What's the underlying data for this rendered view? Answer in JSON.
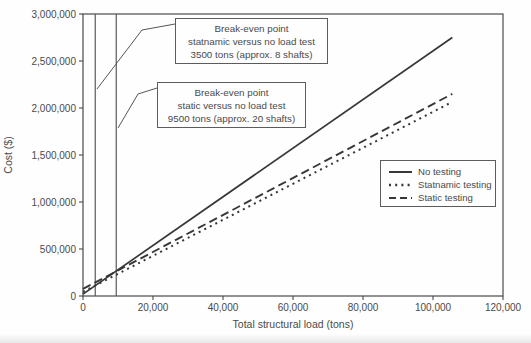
{
  "chart_data": {
    "type": "line",
    "title": "",
    "xlabel": "Total structural load (tons)",
    "ylabel": "Cost ($)",
    "xlim": [
      0,
      120000
    ],
    "ylim": [
      0,
      3000000
    ],
    "x_ticks": [
      0,
      20000,
      40000,
      60000,
      80000,
      100000,
      120000
    ],
    "y_ticks": [
      0,
      500000,
      1000000,
      1500000,
      2000000,
      2500000,
      3000000
    ],
    "grid": false,
    "legend_position": "right-center",
    "series": [
      {
        "name": "No testing",
        "style": "solid",
        "points": [
          [
            0,
            20000
          ],
          [
            105500,
            2750000
          ]
        ]
      },
      {
        "name": "Statnamic testing",
        "style": "dotted",
        "points": [
          [
            0,
            45000
          ],
          [
            105500,
            2065000
          ]
        ]
      },
      {
        "name": "Static testing",
        "style": "dashed",
        "points": [
          [
            0,
            75000
          ],
          [
            105500,
            2150000
          ]
        ]
      }
    ],
    "break_even_lines_tons": [
      3500,
      9500
    ]
  },
  "annotations": [
    {
      "line1": "Break-even point",
      "line2": "statnamic versus no load test",
      "line3": "3500 tons (approx. 8 shafts)"
    },
    {
      "line1": "Break-even point",
      "line2": "static versus no load test",
      "line3": "9500 tons (approx. 20 shafts)"
    }
  ],
  "colors": {
    "line": "#373737",
    "text": "#4a4a4a",
    "border": "#5c5c5c",
    "background": "#fefefe"
  }
}
